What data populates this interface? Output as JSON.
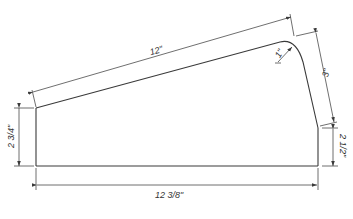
{
  "drawing": {
    "type": "technical-drawing",
    "description": "Dimensioned panel with slanted top edge and rounded corner",
    "colors": {
      "line": "#3a3a3a",
      "background": "#ffffff"
    },
    "dimensions": {
      "top_slant": "12\"",
      "right_slant": "3\"",
      "left_height": "2 3/4\"",
      "right_height": "2 1/2\"",
      "bottom_width": "12 3/8\"",
      "fillet_radius": "1\""
    }
  }
}
